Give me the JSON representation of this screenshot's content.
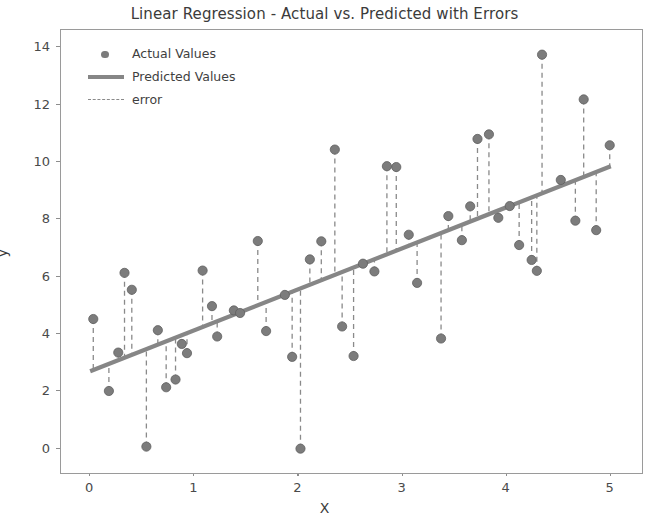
{
  "chart_data": {
    "type": "scatter",
    "title": "Linear Regression - Actual vs. Predicted with Errors",
    "xlabel": "X",
    "ylabel": "y",
    "xlim": [
      -0.28,
      5.3
    ],
    "ylim": [
      -0.85,
      14.6
    ],
    "xticks": [
      0,
      1,
      2,
      3,
      4,
      5
    ],
    "yticks": [
      0,
      2,
      4,
      6,
      8,
      10,
      12,
      14
    ],
    "grid": false,
    "legend_position": "upper left",
    "legend": [
      "Actual Values",
      "Predicted Values",
      "error"
    ],
    "colors": {
      "marker": "#7c7c7c",
      "line": "#868686",
      "error": "#8a8a8a",
      "axes": "#9a9a9a",
      "text": "#3b3b3b"
    },
    "regression_line": {
      "name": "Predicted Values",
      "intercept": 2.7,
      "slope": 1.43,
      "x_start": 0.0,
      "x_end": 5.0,
      "y_start": 2.7,
      "y_end": 9.85
    },
    "series": [
      {
        "name": "Actual Values",
        "points": [
          {
            "x": 0.03,
            "y": 4.52
          },
          {
            "x": 0.18,
            "y": 2.01
          },
          {
            "x": 0.27,
            "y": 3.35
          },
          {
            "x": 0.33,
            "y": 6.13
          },
          {
            "x": 0.4,
            "y": 5.54
          },
          {
            "x": 0.54,
            "y": 0.07
          },
          {
            "x": 0.65,
            "y": 4.13
          },
          {
            "x": 0.73,
            "y": 2.14
          },
          {
            "x": 0.82,
            "y": 2.41
          },
          {
            "x": 0.88,
            "y": 3.65
          },
          {
            "x": 0.93,
            "y": 3.33
          },
          {
            "x": 1.08,
            "y": 6.21
          },
          {
            "x": 1.17,
            "y": 4.97
          },
          {
            "x": 1.22,
            "y": 3.91
          },
          {
            "x": 1.38,
            "y": 4.82
          },
          {
            "x": 1.44,
            "y": 4.73
          },
          {
            "x": 1.61,
            "y": 7.24
          },
          {
            "x": 1.69,
            "y": 4.1
          },
          {
            "x": 1.87,
            "y": 5.36
          },
          {
            "x": 1.94,
            "y": 3.2
          },
          {
            "x": 2.02,
            "y": 0.0
          },
          {
            "x": 2.11,
            "y": 6.6
          },
          {
            "x": 2.22,
            "y": 7.23
          },
          {
            "x": 2.35,
            "y": 10.43
          },
          {
            "x": 2.42,
            "y": 4.26
          },
          {
            "x": 2.53,
            "y": 3.23
          },
          {
            "x": 2.62,
            "y": 6.45
          },
          {
            "x": 2.73,
            "y": 6.18
          },
          {
            "x": 2.85,
            "y": 9.85
          },
          {
            "x": 2.94,
            "y": 9.82
          },
          {
            "x": 3.06,
            "y": 7.46
          },
          {
            "x": 3.14,
            "y": 5.78
          },
          {
            "x": 3.37,
            "y": 3.84
          },
          {
            "x": 3.44,
            "y": 8.11
          },
          {
            "x": 3.57,
            "y": 7.27
          },
          {
            "x": 3.65,
            "y": 8.45
          },
          {
            "x": 3.72,
            "y": 10.8
          },
          {
            "x": 3.83,
            "y": 10.96
          },
          {
            "x": 3.92,
            "y": 8.05
          },
          {
            "x": 4.03,
            "y": 8.46
          },
          {
            "x": 4.12,
            "y": 7.1
          },
          {
            "x": 4.24,
            "y": 6.58
          },
          {
            "x": 4.29,
            "y": 6.2
          },
          {
            "x": 4.34,
            "y": 13.74
          },
          {
            "x": 4.52,
            "y": 9.37
          },
          {
            "x": 4.66,
            "y": 7.95
          },
          {
            "x": 4.74,
            "y": 12.18
          },
          {
            "x": 4.86,
            "y": 7.62
          },
          {
            "x": 4.99,
            "y": 10.58
          }
        ]
      }
    ]
  },
  "legend": {
    "actual_label": "Actual Values",
    "predicted_label": "Predicted Values",
    "error_label": "error"
  },
  "axes": {
    "title": "Linear Regression - Actual vs. Predicted with Errors",
    "xlabel": "X",
    "ylabel": "y"
  }
}
